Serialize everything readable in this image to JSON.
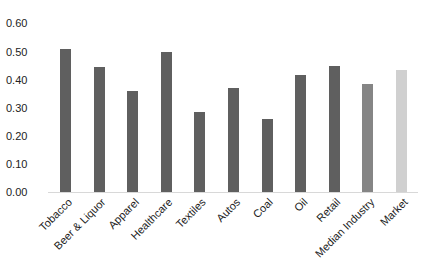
{
  "chart_data": {
    "type": "bar",
    "title": "",
    "xlabel": "",
    "ylabel": "",
    "ylim": [
      0,
      0.6
    ],
    "yticks": [
      "0.00",
      "0.10",
      "0.20",
      "0.30",
      "0.40",
      "0.50",
      "0.60"
    ],
    "grid": false,
    "legend": null,
    "categories": [
      "Tobacco",
      "Beer & Liquor",
      "Apparel",
      "Healthcare",
      "Textiles",
      "Autos",
      "Coal",
      "Oil",
      "Retail",
      "Median Industry",
      "Market"
    ],
    "values": [
      0.51,
      0.445,
      0.36,
      0.5,
      0.285,
      0.37,
      0.26,
      0.415,
      0.45,
      0.385,
      0.435
    ],
    "colors": [
      "#5f5f5f",
      "#5f5f5f",
      "#5f5f5f",
      "#5f5f5f",
      "#5f5f5f",
      "#5f5f5f",
      "#5f5f5f",
      "#5f5f5f",
      "#5f5f5f",
      "#858585",
      "#d0d0d0"
    ]
  }
}
